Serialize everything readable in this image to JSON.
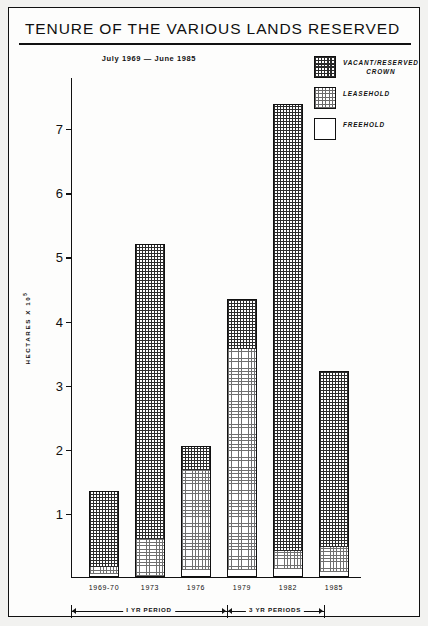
{
  "title": "TENURE OF THE VARIOUS LANDS RESERVED",
  "subtitle": "July 1969 — June 1985",
  "legend": {
    "items": [
      {
        "label_line1": "VACANT/RESERVED",
        "label_line2": "CROWN",
        "pattern": "dense-crosshatch",
        "swatch_name": "swatch-vacant-reserved-crown"
      },
      {
        "label_line1": "LEASEHOLD",
        "label_line2": "",
        "pattern": "light-dotted",
        "swatch_name": "swatch-leasehold"
      },
      {
        "label_line1": "FREEHOLD",
        "label_line2": "",
        "pattern": "blank-white",
        "swatch_name": "swatch-freehold"
      }
    ]
  },
  "axes": {
    "y_title_text": "HECTARES X 10",
    "y_title_exponent": "5",
    "y_ticks": [
      "7",
      "6",
      "5",
      "4",
      "3",
      "2",
      "1"
    ],
    "y_min": 0,
    "y_max": 7.8
  },
  "period_annotation": {
    "left_label": "I YR PERIOD",
    "right_label": "3 YR PERIODS"
  },
  "chart_data": {
    "type": "bar",
    "title": "TENURE OF THE VARIOUS LANDS RESERVED",
    "subtitle": "July 1969 — June 1985",
    "xlabel": "",
    "ylabel": "HECTARES X 10^5",
    "ylim": [
      0,
      7.8
    ],
    "yticks": [
      1,
      2,
      3,
      4,
      5,
      6,
      7
    ],
    "grid": false,
    "stacked": true,
    "legend_position": "top-right",
    "categories": [
      "1969-70",
      "1973",
      "1976",
      "1979",
      "1982",
      "1985"
    ],
    "series": [
      {
        "name": "FREEHOLD",
        "values": [
          0.04,
          0.0,
          0.1,
          0.1,
          0.12,
          0.07
        ]
      },
      {
        "name": "LEASEHOLD",
        "values": [
          0.11,
          0.59,
          1.56,
          3.46,
          0.28,
          0.4
        ]
      },
      {
        "name": "VACANT/RESERVED CROWN",
        "values": [
          1.18,
          4.6,
          0.38,
          0.77,
          6.98,
          2.74
        ]
      }
    ],
    "totals": [
      1.33,
      5.19,
      2.04,
      4.33,
      7.38,
      3.21
    ]
  },
  "bars": [
    {
      "x_label": "1969-70",
      "total": 1.33,
      "freehold": 0.04,
      "leasehold": 0.11,
      "crown": 1.18
    },
    {
      "x_label": "1973",
      "total": 5.19,
      "freehold": 0.0,
      "leasehold": 0.59,
      "crown": 4.6
    },
    {
      "x_label": "1976",
      "total": 2.04,
      "freehold": 0.1,
      "leasehold": 1.56,
      "crown": 0.38
    },
    {
      "x_label": "1979",
      "total": 4.33,
      "freehold": 0.1,
      "leasehold": 3.46,
      "crown": 0.77
    },
    {
      "x_label": "1982",
      "total": 7.38,
      "freehold": 0.12,
      "leasehold": 0.28,
      "crown": 6.98
    },
    {
      "x_label": "1985",
      "total": 3.21,
      "freehold": 0.07,
      "leasehold": 0.4,
      "crown": 2.74
    }
  ]
}
